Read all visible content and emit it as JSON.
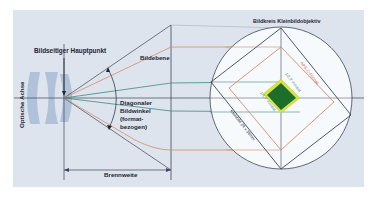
{
  "colors": {
    "background": "#ffffff",
    "panel": "#dde4ed",
    "lens": "#a8bdd6",
    "dark_line": "#3c4658",
    "orange_line": "#d98a68",
    "teal_line": "#3f8a80",
    "circle_fill": "#f6fafc",
    "sensor_green": "#1d6e2a",
    "sensor_yellow": "#d7e04a"
  },
  "labels": {
    "principal_point": "Bildseitiger Hauptpunkt",
    "image_plane": "Bildebene",
    "optical_axis": "Optische Achse",
    "diagonal_angle_line1": "Diagonaler",
    "diagonal_angle_line2": "Bildwinkel",
    "diagonal_angle_line3": "(format-",
    "diagonal_angle_line4": "bezogen)",
    "focal_length": "Brennweite",
    "image_circle_title": "Bildkreis Kleinbildobjektiv",
    "format_aps_c": "APS-C-Format",
    "format_1_2_3": "1/2,3\"-Format",
    "format_1_1_7": "1/1,7\"-Format",
    "format_full_frame": "Kleinbild 24 x 36mm"
  }
}
